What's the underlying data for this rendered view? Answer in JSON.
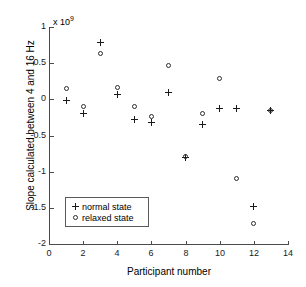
{
  "chart_data": {
    "type": "scatter",
    "title": "",
    "xlabel": "Participant number",
    "ylabel": "Slope calculated between 4 and 16 Hz",
    "y_exponent_label": "x 10",
    "y_exponent_value": "9",
    "xlim": [
      0,
      14
    ],
    "ylim": [
      -2,
      1
    ],
    "xticks": [
      0,
      2,
      4,
      6,
      8,
      10,
      12,
      14
    ],
    "xticklabels": [
      "0",
      "2",
      "4",
      "6",
      "8",
      "10",
      "12",
      "14"
    ],
    "yticks": [
      1,
      0.5,
      0,
      -0.5,
      -1,
      -1.5,
      -2
    ],
    "yticklabels": [
      "1",
      "0.5",
      "0",
      "-0.5",
      "-1",
      "-1.5",
      "-2"
    ],
    "grid": false,
    "legend_position": "lower left",
    "x": [
      1,
      2,
      3,
      4,
      5,
      6,
      7,
      8,
      9,
      10,
      11,
      12,
      13
    ],
    "series": [
      {
        "name": "normal state",
        "marker": "plus",
        "values": [
          -0.01,
          -0.2,
          0.79,
          0.07,
          -0.28,
          -0.32,
          0.09,
          -0.8,
          -0.35,
          -0.12,
          -0.12,
          -1.48,
          -0.16
        ]
      },
      {
        "name": "relaxed state",
        "marker": "circle",
        "values": [
          0.15,
          -0.1,
          0.64,
          0.16,
          -0.1,
          -0.24,
          0.47,
          -0.79,
          -0.19,
          0.29,
          -1.09,
          -1.72,
          -0.16
        ]
      }
    ],
    "legend": [
      "normal state",
      "relaxed state"
    ],
    "marker_color": "#1a1a1a",
    "axis_color": "#4a4a4a"
  }
}
